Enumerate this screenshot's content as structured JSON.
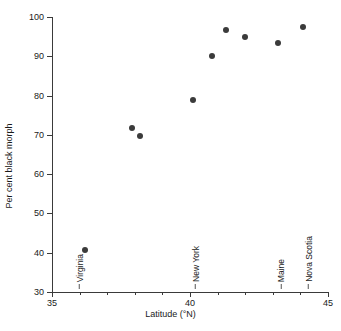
{
  "chart_data": {
    "type": "scatter",
    "title": "",
    "xlabel": "Latitude (°N)",
    "ylabel": "Per cent black morph",
    "xlim": [
      35,
      45
    ],
    "ylim": [
      30,
      100
    ],
    "grid": false,
    "legend": null,
    "x_ticks": [
      35,
      36,
      37,
      38,
      39,
      40,
      41,
      42,
      43,
      44,
      45
    ],
    "x_tick_labels": [
      "35",
      "",
      "",
      "",
      "",
      "40",
      "",
      "",
      "",
      "",
      "45"
    ],
    "y_ticks": [
      30,
      40,
      50,
      60,
      70,
      80,
      90,
      100
    ],
    "y_tick_labels": [
      "30",
      "40",
      "50",
      "60",
      "70",
      "80",
      "90",
      "100"
    ],
    "marker": {
      "shape": "circle",
      "color": "#3b3b3b",
      "size_px": 6
    },
    "points": [
      {
        "x": 36.2,
        "y": 40.6
      },
      {
        "x": 37.9,
        "y": 71.7
      },
      {
        "x": 38.2,
        "y": 69.8
      },
      {
        "x": 40.1,
        "y": 78.8
      },
      {
        "x": 40.8,
        "y": 90.0
      },
      {
        "x": 41.3,
        "y": 96.6
      },
      {
        "x": 42.0,
        "y": 94.8
      },
      {
        "x": 43.2,
        "y": 93.3
      },
      {
        "x": 44.1,
        "y": 97.4
      }
    ],
    "annotations": [
      {
        "label": "Virginia",
        "x": 36.0
      },
      {
        "label": "New York",
        "x": 40.2
      },
      {
        "label": "Maine",
        "x": 43.3
      },
      {
        "label": "Nova Scotia",
        "x": 44.3
      }
    ]
  }
}
